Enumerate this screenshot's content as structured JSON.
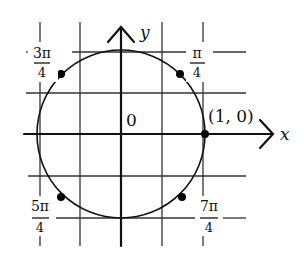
{
  "diagram": {
    "type": "unit-circle",
    "axes": {
      "x_label": "x",
      "y_label": "y",
      "origin_label": "0"
    },
    "point_label": "(1, 0)",
    "angle_labels": [
      {
        "id": "pi_over_4",
        "numerator": "π",
        "denominator": "4"
      },
      {
        "id": "three_pi_over_4",
        "numerator": "3π",
        "denominator": "4"
      },
      {
        "id": "five_pi_over_4",
        "numerator": "5π",
        "denominator": "4"
      },
      {
        "id": "seven_pi_over_4",
        "numerator": "7π",
        "denominator": "4"
      }
    ],
    "marked_points": [
      "π/4",
      "3π/4",
      "5π/4",
      "7π/4",
      "(1, 0)"
    ],
    "colors": {
      "ink": "#111111",
      "grid": "#333333",
      "background": "#ffffff"
    }
  }
}
